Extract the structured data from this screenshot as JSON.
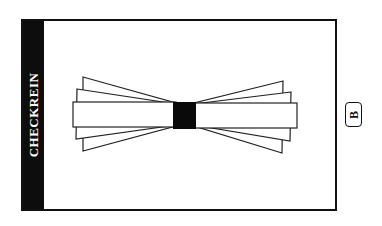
{
  "card": {
    "title": "CHECKREIN",
    "variant_badge": "B",
    "illustration": {
      "icon": "checkrein-bowtie-icon",
      "description": "Fanned bowtie of rectangular cards converging on a central black square"
    }
  },
  "colors": {
    "ink": "#111111",
    "sidebar": "#0d0d0d",
    "background": "#ffffff"
  }
}
